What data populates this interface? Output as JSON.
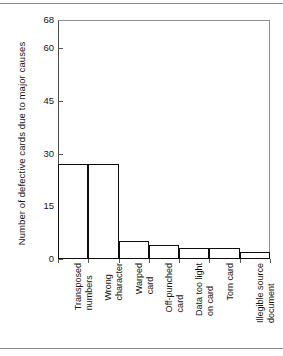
{
  "chart_data": {
    "type": "bar",
    "title": "",
    "xlabel": "",
    "ylabel": "Number of defective cards  due to major causes",
    "ylim": [
      0,
      68
    ],
    "yticks": [
      0,
      15,
      30,
      45,
      60,
      68
    ],
    "ytick_labels": [
      "0",
      "15",
      "30",
      "45",
      "60",
      "68"
    ],
    "grid": false,
    "legend": null,
    "categories": [
      "Transposed numbers",
      "Wrong character",
      "Warped card",
      "Off-punched card",
      "Data too light on card",
      "Torn card",
      "Illegible source document"
    ],
    "category_lines": [
      [
        "Transposed",
        "numbers"
      ],
      [
        "Wrong",
        "character"
      ],
      [
        "Warped",
        "card"
      ],
      [
        "Off-punched",
        "card"
      ],
      [
        "Data too light",
        "on card"
      ],
      [
        "Torn card"
      ],
      [
        "Illegible source",
        "document"
      ]
    ],
    "values": [
      27,
      27,
      5,
      4,
      3,
      3,
      2
    ],
    "bar_fill": "#ffffff",
    "bar_edge": "#0d0d0d",
    "axis_color": "#4a4a4a",
    "background": "#ffffff"
  }
}
